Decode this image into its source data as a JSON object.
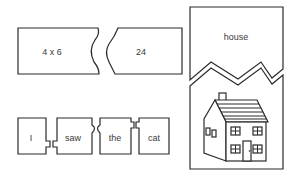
{
  "figure": {
    "math_puzzle": {
      "left_piece": "4 x 6",
      "right_piece": "24"
    },
    "word_picture_puzzle": {
      "word_piece": "house",
      "picture_piece": "house-illustration"
    },
    "sentence_puzzle": {
      "words": [
        "I",
        "saw",
        "the",
        "cat"
      ]
    },
    "colors": {
      "stroke": "#2a2a2a",
      "text": "#3a3a3a",
      "background": "#ffffff"
    }
  }
}
